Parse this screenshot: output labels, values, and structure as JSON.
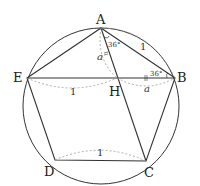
{
  "diagram": {
    "type": "regular pentagon inscribed in circle",
    "points": {
      "A": {
        "label": "A",
        "x": 101,
        "y": 28
      },
      "B": {
        "label": "B",
        "x": 175,
        "y": 78
      },
      "C": {
        "label": "C",
        "x": 146,
        "y": 161
      },
      "D": {
        "label": "D",
        "x": 55,
        "y": 160
      },
      "E": {
        "label": "E",
        "x": 27,
        "y": 78
      },
      "H": {
        "label": "H",
        "x": 117,
        "y": 78
      }
    },
    "labels": {
      "A": "A",
      "B": "B",
      "C": "C",
      "D": "D",
      "E": "E",
      "H": "H",
      "side_AB": "1",
      "segment_EH": "1",
      "side_DC": "1",
      "segment_AH": "a",
      "segment_HB": "a",
      "angle_A": "36°",
      "angle_B": "36°"
    },
    "colors": {
      "line": "#333333",
      "dashed": "#999999",
      "background": "#ffffff"
    }
  }
}
